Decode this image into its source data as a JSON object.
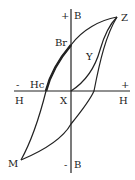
{
  "diagram": {
    "colors": {
      "line": "#222222",
      "background": "#ffffff"
    },
    "axes": {
      "vertical": {
        "top_label_sign": "+",
        "top_label": "B",
        "bottom_label_sign": "-",
        "bottom_label": "B"
      },
      "horizontal": {
        "left_sign": "-",
        "left_label": "H",
        "right_sign": "+",
        "right_label": "H"
      },
      "origin_label": "X"
    },
    "points": {
      "saturation_positive": "Z",
      "saturation_negative": "M",
      "remanence": "Br",
      "coercivity": "Hc",
      "initial_curve": "Y"
    }
  }
}
